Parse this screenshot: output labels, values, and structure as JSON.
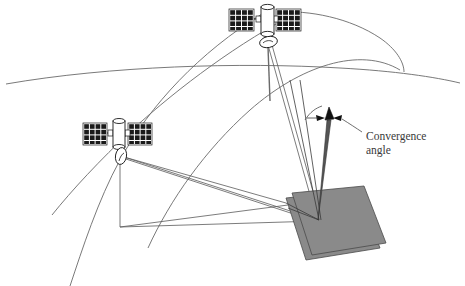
{
  "figure": {
    "background_color": "#ffffff",
    "line_color": "#555555",
    "dark_line_color": "#1a1a1a",
    "ground_fill_color": "#8a8a8a",
    "ground_stroke_color": "#4a4a4a",
    "panel_fill_color": "#1a1a1a",
    "body_fill_color": "#ffffff"
  },
  "annotations": {
    "convergence_label_line1": "Convergence",
    "convergence_label_line2": "angle"
  },
  "elements": {
    "earth_horizon_name": "earth-horizon-curve",
    "orbit_track_1_name": "orbit-track-left",
    "orbit_track_2_name": "orbit-track-right",
    "satellite_top_name": "satellite-top",
    "satellite_left_name": "satellite-left",
    "target_patch_name": "ground-target-patch",
    "convergence_vector_name": "convergence-vector-arrow"
  },
  "satellites": [
    {
      "id": "satellite-top",
      "label": "Top satellite",
      "body_x": 258,
      "body_y": 18,
      "panels": 2,
      "panel_columns": 4,
      "panel_rows": 4,
      "sensor": "antenna-ellipse"
    },
    {
      "id": "satellite-left",
      "label": "Left satellite",
      "body_x": 110,
      "body_y": 132,
      "panels": 2,
      "panel_columns": 4,
      "panel_rows": 4,
      "sensor": "antenna-ellipse"
    }
  ],
  "geometry": {
    "target_point": {
      "x": 319,
      "y": 219
    },
    "nadir_point_left": {
      "x": 120,
      "y": 227
    },
    "nadir_point_top": {
      "x": 270,
      "y": 100
    },
    "vector_tip": {
      "x": 330,
      "y": 113
    },
    "vector_base": {
      "x": 319,
      "y": 219
    }
  }
}
